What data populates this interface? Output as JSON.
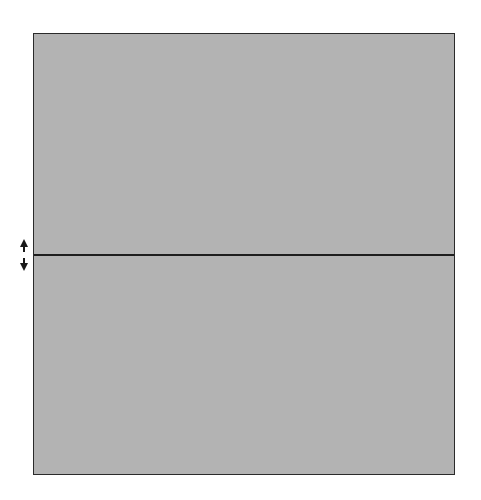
{
  "splitter": {
    "orientation": "horizontal",
    "divider_position_px": 254,
    "pane_color": "#b3b3b3",
    "border_color": "#2a2a2a",
    "divider_color": "#1e1e1e",
    "handle_icon": "vertical-double-arrow-icon"
  }
}
